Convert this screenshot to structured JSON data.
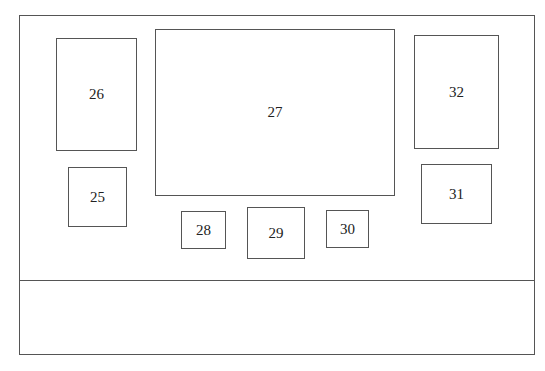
{
  "diagram": {
    "boxes": [
      {
        "id": "26",
        "label": "26",
        "x": 56,
        "y": 38,
        "w": 81,
        "h": 113
      },
      {
        "id": "25",
        "label": "25",
        "x": 68,
        "y": 167,
        "w": 59,
        "h": 60
      },
      {
        "id": "27",
        "label": "27",
        "x": 155,
        "y": 29,
        "w": 240,
        "h": 167
      },
      {
        "id": "28",
        "label": "28",
        "x": 181,
        "y": 211,
        "w": 45,
        "h": 38
      },
      {
        "id": "29",
        "label": "29",
        "x": 247,
        "y": 207,
        "w": 58,
        "h": 52
      },
      {
        "id": "30",
        "label": "30",
        "x": 326,
        "y": 210,
        "w": 43,
        "h": 38
      },
      {
        "id": "32",
        "label": "32",
        "x": 414,
        "y": 35,
        "w": 85,
        "h": 114
      },
      {
        "id": "31",
        "label": "31",
        "x": 421,
        "y": 164,
        "w": 71,
        "h": 60
      }
    ]
  }
}
